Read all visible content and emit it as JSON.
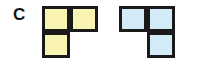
{
  "figure": {
    "label": "C",
    "background_color": "#ffffff",
    "outline_color": "#1a1a1a",
    "shapes": [
      {
        "name": "yellow-tromino",
        "type": "L-tromino",
        "fill_color": "#f9f4b4",
        "cells": [
          {
            "row": 0,
            "col": 0,
            "filled": true
          },
          {
            "row": 0,
            "col": 1,
            "filled": true
          },
          {
            "row": 1,
            "col": 0,
            "filled": true
          },
          {
            "row": 1,
            "col": 1,
            "filled": false
          }
        ]
      },
      {
        "name": "blue-tromino",
        "type": "J-tromino",
        "fill_color": "#d3ebf7",
        "cells": [
          {
            "row": 0,
            "col": 0,
            "filled": true
          },
          {
            "row": 0,
            "col": 1,
            "filled": true
          },
          {
            "row": 1,
            "col": 0,
            "filled": false
          },
          {
            "row": 1,
            "col": 1,
            "filled": true
          }
        ]
      }
    ]
  }
}
